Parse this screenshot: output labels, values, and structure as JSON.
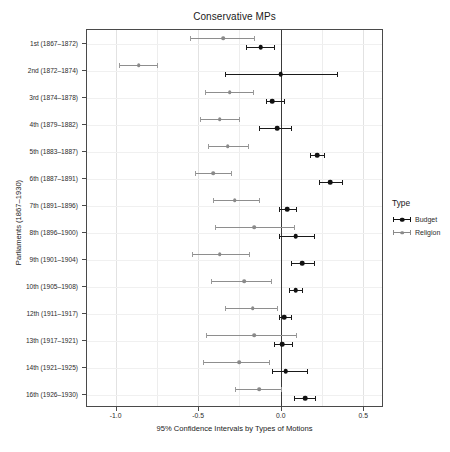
{
  "chart_data": {
    "type": "scatter",
    "title": "Conservative MPs",
    "xlabel": "95% Confidence Intervals by Types of Motions",
    "ylabel": "Parliaments (1867–1930)",
    "xlim": [
      -1.18,
      0.62
    ],
    "xticks": [
      -1.0,
      -0.5,
      0.0,
      0.5
    ],
    "xticklabels": [
      "-1.0",
      "-0.5",
      "0.0",
      "0.5"
    ],
    "grid": true,
    "zero_reference_line": 0.0,
    "legend": {
      "title": "Type",
      "position": "right",
      "entries": [
        {
          "name": "Budget",
          "color": "#111111"
        },
        {
          "name": "Religion",
          "color": "#8a8a8a"
        }
      ]
    },
    "categories": [
      "1st (1867–1872)",
      "2nd (1872–1874)",
      "3rd (1874–1878)",
      "4th (1879–1882)",
      "5th (1883–1887)",
      "6th (1887–1891)",
      "7th (1891–1896)",
      "8th (1896–1900)",
      "9th (1901–1904)",
      "10th (1905–1908)",
      "12th (1911–1917)",
      "13th (1917–1921)",
      "14th (1921–1925)",
      "16th (1926–1930)"
    ],
    "series": [
      {
        "name": "Budget",
        "color": "#111111",
        "estimates": [
          -0.12,
          0.0,
          -0.05,
          -0.02,
          0.22,
          0.3,
          0.04,
          0.09,
          0.13,
          0.09,
          0.02,
          0.01,
          0.03,
          0.15
        ],
        "ci_low": [
          -0.21,
          -0.34,
          -0.09,
          -0.13,
          0.18,
          0.23,
          -0.01,
          -0.01,
          0.06,
          0.05,
          -0.01,
          -0.04,
          -0.05,
          0.08
        ],
        "ci_high": [
          -0.04,
          0.34,
          0.02,
          0.06,
          0.26,
          0.37,
          0.09,
          0.2,
          0.2,
          0.13,
          0.06,
          0.07,
          0.16,
          0.21
        ]
      },
      {
        "name": "Religion",
        "color": "#8a8a8a",
        "estimates": [
          -0.35,
          -0.86,
          -0.31,
          -0.37,
          -0.32,
          -0.41,
          -0.28,
          -0.16,
          -0.37,
          -0.22,
          -0.17,
          -0.16,
          -0.25,
          -0.13
        ],
        "ci_low": [
          -0.55,
          -0.98,
          -0.46,
          -0.49,
          -0.44,
          -0.52,
          -0.41,
          -0.4,
          -0.54,
          -0.42,
          -0.34,
          -0.45,
          -0.47,
          -0.28
        ],
        "ci_high": [
          -0.16,
          -0.75,
          -0.17,
          -0.25,
          -0.2,
          -0.3,
          -0.13,
          0.08,
          -0.19,
          -0.06,
          -0.02,
          0.09,
          -0.07,
          0.0
        ]
      }
    ]
  }
}
